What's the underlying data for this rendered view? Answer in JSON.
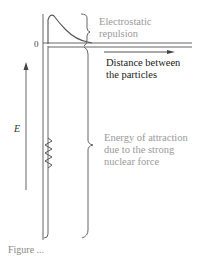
{
  "diagram": {
    "labels": {
      "repulsion": [
        "Electrostatic",
        "repulsion"
      ],
      "distance": [
        "Distance between",
        "the particles"
      ],
      "attraction": [
        "Energy of attraction",
        "due to the strong",
        "nuclear force"
      ],
      "zero": "0",
      "energy_axis": "E"
    },
    "caption_partial": "Figure ...",
    "colors": {
      "lines": "#555555",
      "grey_text": "#9a9a9a",
      "dark_text": "#222222",
      "background": "#ffffff"
    },
    "elements": [
      "energy axis arrow (upward, labelled E)",
      "potential well walls (double vertical line)",
      "zero-energy baseline (double horizontal line)",
      "distance arrow (rightward)",
      "repulsion curve (positive bump near origin)",
      "zigzag (spring) symbol inside well",
      "brace marking repulsion region",
      "brace marking attraction region"
    ]
  }
}
